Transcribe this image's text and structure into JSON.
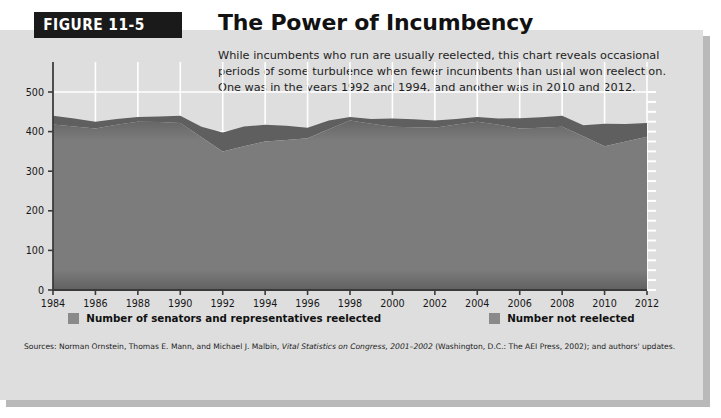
{
  "figure": {
    "banner_label": "FIGURE 11-5",
    "title": "The Power of Incumbency",
    "description": "While incumbents who run are usually reelected, this chart reveals occasional periods of some turbulence when fewer incumbents than usual won reelection. One was in the years 1992 and 1994, and another was in 2010 and 2012."
  },
  "source": {
    "prefix": "Sources: Norman Ornstein, Thomas E. Mann, and Michael J. Malbin, ",
    "italic": "Vital Statistics on Congress, 2001–2002",
    "suffix": " (Washington, D.C.: The AEI Press, 2002); and authors' updates."
  },
  "colors": {
    "panel_background": "#dedede",
    "series_reelected": "#7c7c7c",
    "series_not_reelected": "#5f5f5f",
    "gridline": "#ffffff",
    "axis": "#3a3a3a",
    "banner": "#1a1a1a"
  },
  "chart_data": {
    "type": "area",
    "stacked": true,
    "title": "The Power of Incumbency",
    "xlabel": "",
    "ylabel": "",
    "xlim": [
      1984,
      2012
    ],
    "ylim": [
      0,
      500
    ],
    "ytick_step": 100,
    "xtick_step": 2,
    "grid": true,
    "legend_position": "bottom",
    "x": [
      1984,
      1985,
      1986,
      1987,
      1988,
      1989,
      1990,
      1991,
      1992,
      1993,
      1994,
      1995,
      1996,
      1997,
      1998,
      1999,
      2000,
      2001,
      2002,
      2003,
      2004,
      2005,
      2006,
      2007,
      2008,
      2009,
      2010,
      2011,
      2012
    ],
    "xtick_labels": [
      "1984",
      "1986",
      "1988",
      "1990",
      "1992",
      "1994",
      "1996",
      "1998",
      "2000",
      "2002",
      "2004",
      "2006",
      "2008",
      "2010",
      "2012"
    ],
    "ytick_labels": [
      "0",
      "100",
      "200",
      "300",
      "400",
      "500"
    ],
    "series": [
      {
        "name": "Number of senators and representatives reelected",
        "color": "#7c7c7c",
        "values": [
          418,
          413,
          408,
          417,
          425,
          424,
          422,
          386,
          350,
          363,
          375,
          379,
          383,
          406,
          428,
          420,
          412,
          411,
          410,
          418,
          425,
          417,
          408,
          410,
          412,
          388,
          363,
          375,
          387
        ]
      },
      {
        "name": "Number not reelected",
        "color": "#5f5f5f",
        "values": [
          22,
          20,
          17,
          15,
          12,
          14,
          18,
          26,
          48,
          50,
          42,
          36,
          27,
          22,
          9,
          12,
          21,
          20,
          18,
          14,
          12,
          16,
          26,
          26,
          28,
          28,
          57,
          44,
          35
        ]
      }
    ],
    "totals": [
      440,
      433,
      425,
      432,
      437,
      438,
      440,
      412,
      398,
      413,
      417,
      415,
      410,
      428,
      437,
      432,
      433,
      431,
      428,
      432,
      437,
      433,
      434,
      436,
      440,
      416,
      420,
      419,
      422
    ]
  }
}
